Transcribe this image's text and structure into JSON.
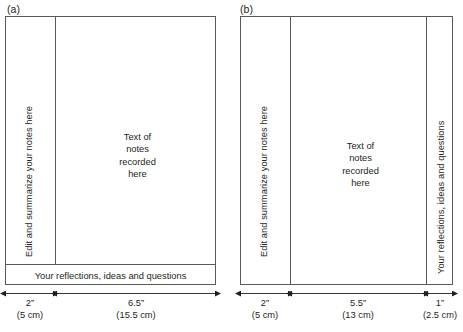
{
  "figure": {
    "panels": [
      {
        "id": "a",
        "label": "(a)",
        "left_column_text": "Edit and summarize your notes here",
        "center_text": "Text of\nnotes\nrecorded\nhere",
        "bottom_bar_text": "Your reflections, ideas and questions",
        "right_column_text": null,
        "dimensions": [
          {
            "inches": "2”",
            "cm": "(5 cm)"
          },
          {
            "inches": "6.5”",
            "cm": "(15.5 cm)"
          }
        ]
      },
      {
        "id": "b",
        "label": "(b)",
        "left_column_text": "Edit and summarize your notes here",
        "center_text": "Text of\nnotes\nrecorded\nhere",
        "bottom_bar_text": null,
        "right_column_text": "Your reflections, ideas and questions",
        "dimensions": [
          {
            "inches": "2”",
            "cm": "(5 cm)"
          },
          {
            "inches": "5.5”",
            "cm": "(13 cm)"
          },
          {
            "inches": "1”",
            "cm": "(2.5 cm)"
          }
        ]
      }
    ],
    "colors": {
      "line": "#58595b",
      "text": "#231f20",
      "background": "#ffffff"
    }
  }
}
